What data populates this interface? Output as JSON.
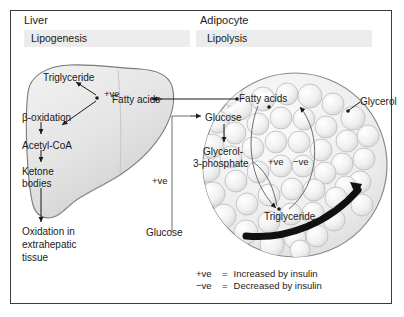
{
  "figure": {
    "title_left": "Liver",
    "title_right": "Adipocyte",
    "process_left": "Lipogenesis",
    "process_right": "Lipolysis"
  },
  "liver": {
    "triglyceride": "Triglyceride",
    "fatty_acids": "Fatty acids",
    "beta_oxidation": "β-oxidation",
    "acetyl_coa": "Acetyl-CoA",
    "ketone_bodies_line1": "Ketone",
    "ketone_bodies_line2": "bodies",
    "oxidation_line1": "Oxidation in",
    "oxidation_line2": "extrahepatic",
    "oxidation_line3": "tissue",
    "ve_lipogenesis": "+ve"
  },
  "adipocyte": {
    "fatty_acids": "Fatty acids",
    "glycerol": "Glycerol",
    "glucose": "Glucose",
    "glycerol3p_line1": "Glycerol-",
    "glycerol3p_line2": "3-phosphate",
    "triglyceride": "Triglyceride",
    "ve_positive": "+ve",
    "ve_negative": "−ve"
  },
  "middle": {
    "glucose": "Glucose",
    "ve_positive": "+ve"
  },
  "legend": {
    "pos_symbol": "+ve",
    "pos_eq": "=",
    "pos_text": "Increased by insulin",
    "neg_symbol": "−ve",
    "neg_eq": "=",
    "neg_text": "Decreased by insulin"
  },
  "colors": {
    "ink": "#1a1a1a",
    "frame": "#3b3b3b",
    "band": "#ececec",
    "organ_fill": "#e9e9e9",
    "organ_stroke": "#6e6e6e",
    "droplet_stroke": "#b9b9b9",
    "black_arrow": "#111111"
  }
}
